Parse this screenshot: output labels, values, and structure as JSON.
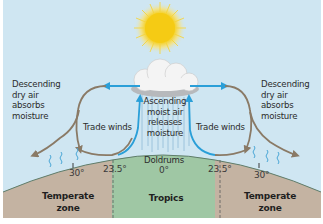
{
  "diagram": {
    "colors": {
      "sky": "#cfe6f2",
      "tropics_ground": "#9fc7a4",
      "temperate_ground": "#c4b3a2",
      "ground_edge": "#5f7d6b",
      "descending_arrow": "#8a7a66",
      "ascending_arrow": "#2a9fd8",
      "sun": "#f6cf1c",
      "cloud": "#f4f4f4",
      "moisture_squiggle": "#4aa6d6",
      "rain": "#8ab8d4",
      "divider": "#5a5a5a",
      "background": "#ffffff"
    },
    "labels": {
      "left_descending": "Descending\ndry air\nabsorbs\nmoisture",
      "right_descending": "Descending\ndry air\nabsorbs\nmoisture",
      "center_ascending": "Ascending\nmoist air\nreleases\nmoisture",
      "left_trade_winds": "Trade winds",
      "right_trade_winds": "Trade winds",
      "doldrums": "Doldrums",
      "equator_lat": "0°",
      "left_tropic_lat": "23.5°",
      "right_tropic_lat": "23.5°",
      "left_30_lat": "30°",
      "right_30_lat": "30°",
      "left_zone": "Temperate\nzone",
      "center_zone": "Tropics",
      "right_zone": "Temperate\nzone"
    },
    "icons": [
      "sun-icon",
      "cloud-icon",
      "rain-icon",
      "moisture-squiggle-icon"
    ]
  }
}
